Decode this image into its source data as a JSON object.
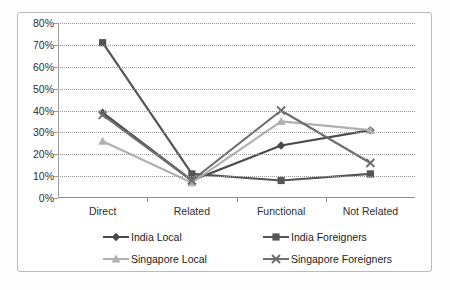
{
  "chart_data": {
    "type": "line",
    "title": "",
    "xlabel": "",
    "ylabel": "",
    "categories": [
      "Direct",
      "Related",
      "Functional",
      "Not Related"
    ],
    "ylim": [
      0,
      80
    ],
    "ytick_step": 10,
    "ytick_labels": [
      "0%",
      "10%",
      "20%",
      "30%",
      "40%",
      "50%",
      "60%",
      "70%",
      "80%"
    ],
    "grid": true,
    "legend_position": "bottom",
    "series": [
      {
        "name": "India  Local",
        "marker": "diamond",
        "color": "#4a4a4a",
        "values": [
          39,
          8,
          24,
          31
        ]
      },
      {
        "name": "India  Foreigners",
        "marker": "square",
        "color": "#555555",
        "values": [
          71,
          11,
          8,
          11
        ]
      },
      {
        "name": "Singapore Local",
        "marker": "triangle",
        "color": "#b0b0b0",
        "values": [
          26,
          7,
          35,
          31
        ]
      },
      {
        "name": "Singapore Foreigners",
        "marker": "cross",
        "color": "#6e6e6e",
        "values": [
          38,
          8,
          40,
          16
        ]
      }
    ]
  },
  "colors": {
    "gridline": "#9a9a9a",
    "axis": "#9d9d9d",
    "frame": "#b9b9b9",
    "text": "#2f2f2f",
    "background": "#ffffff"
  }
}
